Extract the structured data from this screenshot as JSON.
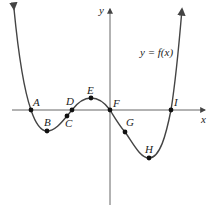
{
  "diagram": {
    "function_label": "y = f(x)",
    "x_axis_label": "x",
    "y_axis_label": "y",
    "points": [
      {
        "name": "A",
        "cx": 31,
        "cy": 110,
        "lx": 33,
        "ly": 106
      },
      {
        "name": "B",
        "cx": 47,
        "cy": 131,
        "lx": 44,
        "ly": 126
      },
      {
        "name": "C",
        "cx": 67,
        "cy": 116,
        "lx": 65,
        "ly": 127
      },
      {
        "name": "D",
        "cx": 72,
        "cy": 110,
        "lx": 66,
        "ly": 105
      },
      {
        "name": "E",
        "cx": 91,
        "cy": 98,
        "lx": 87,
        "ly": 94
      },
      {
        "name": "F",
        "cx": 110,
        "cy": 110,
        "lx": 113,
        "ly": 107
      },
      {
        "name": "G",
        "cx": 125,
        "cy": 132,
        "lx": 126,
        "ly": 126
      },
      {
        "name": "H",
        "cx": 149,
        "cy": 158,
        "lx": 145,
        "ly": 153
      },
      {
        "name": "I",
        "cx": 171,
        "cy": 110,
        "lx": 174,
        "ly": 106
      }
    ]
  }
}
